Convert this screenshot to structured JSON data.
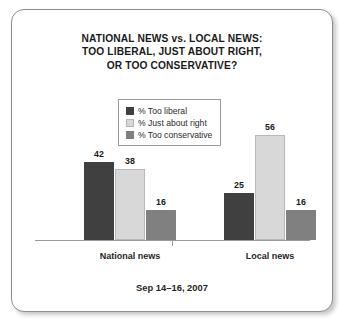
{
  "chart_data": {
    "type": "bar",
    "title": "NATIONAL NEWS vs. LOCAL NEWS: TOO LIBERAL, JUST ABOUT RIGHT, OR TOO CONSERVATIVE?",
    "title_lines": [
      "NATIONAL NEWS vs. LOCAL NEWS:",
      "TOO LIBERAL, JUST ABOUT RIGHT,",
      "OR TOO CONSERVATIVE?"
    ],
    "subtitle": "",
    "xlabel": "",
    "ylabel": "",
    "ylim": [
      0,
      60
    ],
    "grid": false,
    "legend_position": "top-center",
    "categories": [
      "National news",
      "Local news"
    ],
    "series": [
      {
        "name": "% Too liberal",
        "color": "#404040",
        "values": [
          42,
          25
        ]
      },
      {
        "name": "% Just about right",
        "color": "#d8d8d8",
        "values": [
          38,
          56
        ]
      },
      {
        "name": "% Too conservative",
        "color": "#808080",
        "values": [
          16,
          16
        ]
      }
    ],
    "annotations": {
      "source_date": "Sep 14–16, 2007"
    }
  },
  "legend": {
    "items": [
      {
        "label": "% Too liberal",
        "color": "#404040"
      },
      {
        "label": "% Just about right",
        "color": "#d8d8d8"
      },
      {
        "label": "% Too conservative",
        "color": "#808080"
      }
    ]
  },
  "footer": {
    "date": "Sep 14–16, 2007"
  }
}
